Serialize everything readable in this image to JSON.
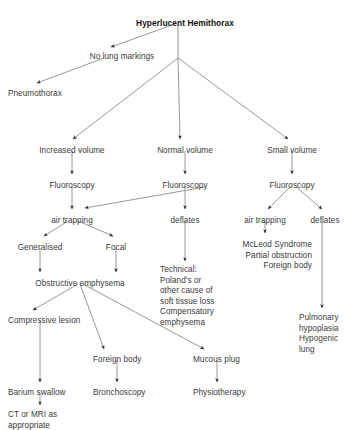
{
  "diagram": {
    "title": "Hyperlucent Hemithorax",
    "type": "clinical-decision-flowchart",
    "canvas": {
      "width": 355,
      "height": 430
    },
    "style": {
      "background": "#ffffff",
      "text_color": "#3a3a3a",
      "title_color": "#121212",
      "edge_color": "#8c8c8c",
      "arrowhead_color": "#2b2b2b"
    },
    "nodes": [
      {
        "id": "root",
        "label": "Hyperlucent Hemithorax",
        "x": 185,
        "y": 18,
        "align": "ctr",
        "bold": true
      },
      {
        "id": "no_markings",
        "label": "No lung markings",
        "x": 122,
        "y": 52,
        "align": "ctr",
        "bold": false
      },
      {
        "id": "pneumothorax",
        "label": "Pneumothorax",
        "x": 8,
        "y": 89,
        "align": "lft",
        "bold": false
      },
      {
        "id": "increased_vol",
        "label": "Increased volume",
        "x": 72,
        "y": 146,
        "align": "ctr",
        "bold": false
      },
      {
        "id": "normal_vol",
        "label": "Normal volume",
        "x": 185,
        "y": 146,
        "align": "ctr",
        "bold": false
      },
      {
        "id": "small_vol",
        "label": "Small volume",
        "x": 292,
        "y": 146,
        "align": "ctr",
        "bold": false
      },
      {
        "id": "fluoro_left",
        "label": "Fluoroscopy",
        "x": 72,
        "y": 181,
        "align": "ctr",
        "bold": false
      },
      {
        "id": "fluoro_mid",
        "label": "Fluoroscopy",
        "x": 185,
        "y": 181,
        "align": "ctr",
        "bold": false
      },
      {
        "id": "fluoro_right",
        "label": "Fluoroscopy",
        "x": 292,
        "y": 181,
        "align": "ctr",
        "bold": false
      },
      {
        "id": "air_trap_left",
        "label": "air trapping",
        "x": 72,
        "y": 216,
        "align": "ctr",
        "bold": false
      },
      {
        "id": "deflates_mid",
        "label": "deflates",
        "x": 185,
        "y": 216,
        "align": "ctr",
        "bold": false
      },
      {
        "id": "air_trap_right",
        "label": "air trapping",
        "x": 265,
        "y": 216,
        "align": "ctr",
        "bold": false
      },
      {
        "id": "deflates_right",
        "label": "deflates",
        "x": 325,
        "y": 216,
        "align": "ctr",
        "bold": false
      },
      {
        "id": "generalised",
        "label": "Generalised",
        "x": 40,
        "y": 243,
        "align": "ctr",
        "bold": false
      },
      {
        "id": "focal",
        "label": "Focal",
        "x": 116,
        "y": 243,
        "align": "ctr",
        "bold": false
      },
      {
        "id": "mcleod",
        "label": "McLeod Syndrome\nPartial obstruction\nForeign body",
        "x": 312,
        "y": 240,
        "align": "rgt",
        "bold": false
      },
      {
        "id": "technical",
        "label": "Technical:\nPoland's or\nother cause of\nsoft tissue loss\nCompensatory\nemphysema",
        "x": 160,
        "y": 265,
        "align": "lft",
        "bold": false
      },
      {
        "id": "obstructive",
        "label": "Obstructive emphysema",
        "x": 80,
        "y": 279,
        "align": "ctr",
        "bold": false
      },
      {
        "id": "compressive",
        "label": "Compressive lesion",
        "x": 8,
        "y": 316,
        "align": "lft",
        "bold": false
      },
      {
        "id": "pulm_hypo",
        "label": "Pulmonary\nhypoplasia\nHypogenic\nlung",
        "x": 299,
        "y": 313,
        "align": "lft",
        "bold": false
      },
      {
        "id": "foreign_body",
        "label": "Foreign body",
        "x": 93,
        "y": 355,
        "align": "lft",
        "bold": false
      },
      {
        "id": "mucous_plug",
        "label": "Mucous plug",
        "x": 193,
        "y": 355,
        "align": "lft",
        "bold": false
      },
      {
        "id": "barium",
        "label": "Barium swallow",
        "x": 8,
        "y": 388,
        "align": "lft",
        "bold": false
      },
      {
        "id": "bronchoscopy",
        "label": "Bronchoscopy",
        "x": 93,
        "y": 388,
        "align": "lft",
        "bold": false
      },
      {
        "id": "physiotherapy",
        "label": "Physiotherapy",
        "x": 193,
        "y": 388,
        "align": "lft",
        "bold": false
      },
      {
        "id": "ct_mri",
        "label": "CT or MRI as\nappropriate",
        "x": 8,
        "y": 410,
        "align": "lft",
        "bold": false
      }
    ],
    "edges": [
      {
        "from": "root",
        "to": "no_markings",
        "path": "M 175 24 L 111 47",
        "arrow": true
      },
      {
        "from": "no_markings",
        "to": "pneumothorax",
        "path": "M 104 58 L 37 83",
        "arrow": true
      },
      {
        "from": "root",
        "to": "fanout",
        "path": "M 178 24 L 178 58",
        "arrow": false
      },
      {
        "from": "fanout",
        "to": "increased_vol",
        "path": "M 178 58 L 73 139",
        "arrow": true
      },
      {
        "from": "fanout",
        "to": "normal_vol",
        "path": "M 178 58 L 180 139",
        "arrow": true
      },
      {
        "from": "fanout",
        "to": "small_vol",
        "path": "M 178 58 L 288 139",
        "arrow": true
      },
      {
        "from": "increased_vol",
        "to": "fluoro_left",
        "path": "M 72 151 L 72 174",
        "arrow": true
      },
      {
        "from": "normal_vol",
        "to": "fluoro_mid",
        "path": "M 185 151 L 185 174",
        "arrow": true
      },
      {
        "from": "small_vol",
        "to": "fluoro_right",
        "path": "M 292 151 L 292 174",
        "arrow": true
      },
      {
        "from": "fluoro_left",
        "to": "air_trap_left",
        "path": "M 72 186 L 72 209",
        "arrow": true
      },
      {
        "from": "fluoro_mid",
        "to": "air_trap_left",
        "path": "M 205 187 L 85 208",
        "arrow": true
      },
      {
        "from": "fluoro_mid",
        "to": "deflates_mid",
        "path": "M 185 186 L 185 209",
        "arrow": true
      },
      {
        "from": "fluoro_right",
        "to": "air_trap_right",
        "path": "M 290 187 L 268 209",
        "arrow": true
      },
      {
        "from": "fluoro_right",
        "to": "deflates_right",
        "path": "M 296 187 L 322 209",
        "arrow": true
      },
      {
        "from": "air_trap_left",
        "to": "generalised",
        "path": "M 68 221 L 44 236",
        "arrow": true
      },
      {
        "from": "air_trap_left",
        "to": "focal",
        "path": "M 78 221 L 113 236",
        "arrow": true
      },
      {
        "from": "generalised",
        "to": "obstructive",
        "path": "M 40 248 L 40 272",
        "arrow": true
      },
      {
        "from": "focal",
        "to": "obstructive",
        "path": "M 116 248 L 116 272",
        "arrow": true
      },
      {
        "from": "deflates_mid",
        "to": "technical",
        "path": "M 185 221 L 185 261",
        "arrow": true
      },
      {
        "from": "air_trap_right",
        "to": "mcleod",
        "path": "M 265 221 L 265 233",
        "arrow": true
      },
      {
        "from": "deflates_right",
        "to": "pulm_hypo",
        "path": "M 322 221 L 322 308",
        "arrow": true
      },
      {
        "from": "obstructive",
        "to": "compressive",
        "path": "M 78 284 L 33 310",
        "arrow": true
      },
      {
        "from": "obstructive",
        "to": "foreign_body",
        "path": "M 80 284 L 104 349",
        "arrow": true
      },
      {
        "from": "obstructive",
        "to": "mucous_plug",
        "path": "M 83 284 L 204 349",
        "arrow": true
      },
      {
        "from": "compressive",
        "to": "barium",
        "path": "M 40 321 L 40 382",
        "arrow": true
      },
      {
        "from": "foreign_body",
        "to": "bronchoscopy",
        "path": "M 117 360 L 117 382",
        "arrow": true
      },
      {
        "from": "mucous_plug",
        "to": "physiotherapy",
        "path": "M 217 360 L 217 382",
        "arrow": true
      },
      {
        "from": "barium",
        "to": "ct_mri",
        "path": "M 40 393 L 40 405",
        "arrow": true
      }
    ]
  }
}
